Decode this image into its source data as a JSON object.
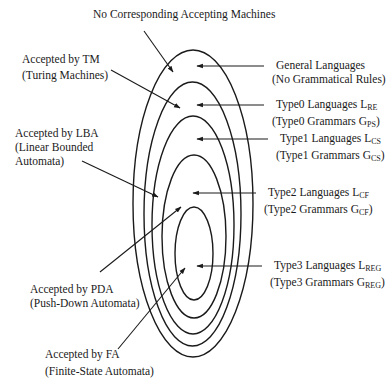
{
  "diagram": {
    "colors": {
      "stroke": "#1a1a1a",
      "background": "#ffffff"
    },
    "top_label": "No Corresponding Accepting Machines",
    "ellipses": [
      {
        "name": "general-languages",
        "cx": 193,
        "cy": 203.5,
        "rx": 60,
        "ry": 153.5
      },
      {
        "name": "type0-languages",
        "cx": 192.5,
        "cy": 214,
        "rx": 48.5,
        "ry": 132
      },
      {
        "name": "type1-languages",
        "cx": 193,
        "cy": 225,
        "rx": 41,
        "ry": 109
      },
      {
        "name": "type2-languages",
        "cx": 194,
        "cy": 236.5,
        "rx": 32,
        "ry": 81.5
      },
      {
        "name": "type3-languages",
        "cx": 194,
        "cy": 253.5,
        "rx": 19,
        "ry": 46.5
      }
    ],
    "left_labels": {
      "tm": {
        "line1": "Accepted by TM",
        "line2": "(Turing Machines)"
      },
      "lba": {
        "line1": "Accepted by LBA",
        "line2": "(Linear Bounded",
        "line3": "Automata)"
      },
      "pda": {
        "line1": "Accepted by PDA",
        "line2": "(Push-Down Automata)"
      },
      "fa": {
        "line1": "Accepted by FA",
        "line2": "(Finite-State Automata)"
      }
    },
    "right_labels": {
      "general": {
        "line1": "General Languages",
        "line2": "(No Grammatical Rules)"
      },
      "type0": {
        "lang": "Type0 Languages L",
        "lang_sub": "RE",
        "gram": "(Type0 Grammars G",
        "gram_sub": "PS",
        "close": ")"
      },
      "type1": {
        "lang": "Type1 Languages L",
        "lang_sub": "CS",
        "gram": "(Type1 Grammars G",
        "gram_sub": "CS",
        "close": ")"
      },
      "type2": {
        "lang": "Type2 Languages L",
        "lang_sub": "CF",
        "gram": "(Type2 Grammars G",
        "gram_sub": "CF",
        "close": ")"
      },
      "type3": {
        "lang": "Type3 Languages L",
        "lang_sub": "REG",
        "gram": "(Type3 Grammars G",
        "gram_sub": "REG",
        "close": ")"
      }
    },
    "arrows": [
      {
        "name": "arrow-no-machines",
        "x1": 144,
        "y1": 31,
        "x2": 173,
        "y2": 72
      },
      {
        "name": "arrow-tm",
        "x1": 111,
        "y1": 70,
        "x2": 180,
        "y2": 108
      },
      {
        "name": "arrow-lba",
        "x1": 82,
        "y1": 161,
        "x2": 158,
        "y2": 197
      },
      {
        "name": "arrow-pda",
        "x1": 100,
        "y1": 272,
        "x2": 181,
        "y2": 207
      },
      {
        "name": "arrow-fa",
        "x1": 118,
        "y1": 349,
        "x2": 185,
        "y2": 268
      },
      {
        "name": "arrow-general",
        "x1": 264,
        "y1": 66,
        "x2": 197,
        "y2": 66
      },
      {
        "name": "arrow-type0",
        "x1": 264,
        "y1": 105,
        "x2": 197,
        "y2": 105
      },
      {
        "name": "arrow-type1",
        "x1": 268,
        "y1": 139,
        "x2": 197,
        "y2": 139
      },
      {
        "name": "arrow-type2",
        "x1": 256,
        "y1": 193,
        "x2": 193,
        "y2": 193
      },
      {
        "name": "arrow-type3",
        "x1": 262,
        "y1": 266,
        "x2": 197,
        "y2": 266
      }
    ]
  }
}
